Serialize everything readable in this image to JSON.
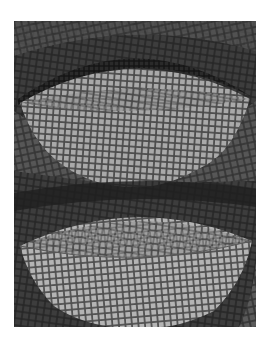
{
  "image": {
    "subject": "Mosaic of two bowls",
    "description": "Grayscale mosaic artwork showing an upper bowl with a dark rim band and a lower bowl, set against dark tessellated background",
    "colors": {
      "background_dark": "#2e2e2e",
      "background_mid": "#555555",
      "upper_bowl_light": "#a8a8a8",
      "upper_bowl_shadow": "#8a8a8a",
      "lower_bowl_light": "#b5b5b5",
      "lower_bowl_inner": "#9a9a9a",
      "rim_band": "#1e1e1e",
      "grout": "#3a3a3a",
      "page_background": "#ffffff"
    }
  }
}
